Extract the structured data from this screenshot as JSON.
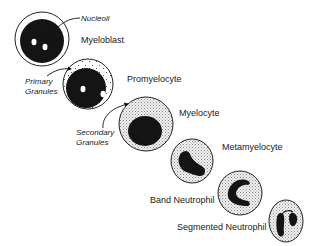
{
  "diagram": {
    "stages": [
      {
        "name": "Myeloblast"
      },
      {
        "name": "Promyelocyte"
      },
      {
        "name": "Myelocyte"
      },
      {
        "name": "Metamyelocyte"
      },
      {
        "name": "Band Neutrophil"
      },
      {
        "name": "Segmented Neutrophil"
      }
    ],
    "annotations": {
      "nucleoli": "Nucleoli",
      "primary_line1": "Primary",
      "primary_line2": "Granules",
      "secondary_line1": "Secondary",
      "secondary_line2": "Granules"
    },
    "colors": {
      "nucleus": "#141414",
      "outline": "#222222",
      "granule_fill": "#dcdcdc",
      "background": "#ffffff"
    }
  }
}
